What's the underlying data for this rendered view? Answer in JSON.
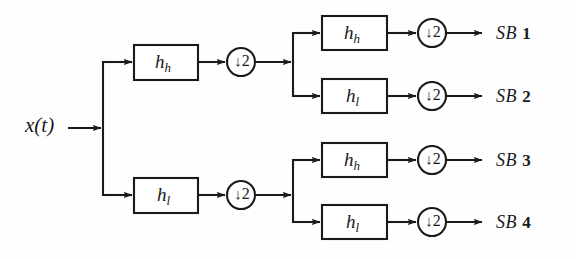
{
  "figure": {
    "background_color": "#fefefe",
    "ink_color": "#1a1a1a",
    "input": {
      "label_main": "x",
      "label_full": "x(t)",
      "x": 25,
      "y": 115
    },
    "decimator_symbol": {
      "arrow": "↓",
      "factor": "2",
      "label": "↓2"
    },
    "stage1": {
      "blocks": [
        {
          "name": "highpass-stage1",
          "base": "h",
          "sub": "h",
          "label": "h_h",
          "box": {
            "x": 134,
            "y": 45,
            "w": 64,
            "h": 35
          },
          "decimator": {
            "cx": 241,
            "cy": 62,
            "r": 14
          }
        },
        {
          "name": "lowpass-stage1",
          "base": "h",
          "sub": "l",
          "label": "h_l",
          "box": {
            "x": 134,
            "y": 178,
            "w": 64,
            "h": 35
          },
          "decimator": {
            "cx": 241,
            "cy": 195,
            "r": 14
          }
        }
      ]
    },
    "stage2": {
      "blocks": [
        {
          "name": "highpass-stage2-a",
          "base": "h",
          "sub": "h",
          "label": "h_h",
          "box": {
            "x": 322,
            "y": 16,
            "w": 65,
            "h": 34
          },
          "decimator": {
            "cx": 432,
            "cy": 33,
            "r": 14
          },
          "output": "SB 1"
        },
        {
          "name": "lowpass-stage2-a",
          "base": "h",
          "sub": "l",
          "label": "h_l",
          "box": {
            "x": 322,
            "y": 79,
            "w": 65,
            "h": 34
          },
          "decimator": {
            "cx": 432,
            "cy": 96,
            "r": 14
          },
          "output": "SB 2"
        },
        {
          "name": "highpass-stage2-b",
          "base": "h",
          "sub": "h",
          "label": "h_h",
          "box": {
            "x": 322,
            "y": 143,
            "w": 65,
            "h": 34
          },
          "decimator": {
            "cx": 432,
            "cy": 160,
            "r": 14
          },
          "output": "SB 3"
        },
        {
          "name": "lowpass-stage2-b",
          "base": "h",
          "sub": "l",
          "label": "h_l",
          "box": {
            "x": 322,
            "y": 205,
            "w": 65,
            "h": 34
          },
          "decimator": {
            "cx": 432,
            "cy": 222,
            "r": 14
          },
          "output": "SB 4"
        }
      ]
    },
    "outputs": [
      {
        "name": "subband-1",
        "prefix": "SB",
        "number": "1",
        "label": "SB 1",
        "x": 496,
        "y": 24
      },
      {
        "name": "subband-2",
        "prefix": "SB",
        "number": "2",
        "label": "SB 2",
        "x": 496,
        "y": 87
      },
      {
        "name": "subband-3",
        "prefix": "SB",
        "number": "3",
        "label": "SB 3",
        "x": 496,
        "y": 151
      },
      {
        "name": "subband-4",
        "prefix": "SB",
        "number": "4",
        "label": "SB 4",
        "x": 496,
        "y": 213
      }
    ],
    "split_nodes": [
      {
        "name": "split-root",
        "x": 103,
        "y_top": 62,
        "y_bottom": 195,
        "y_in": 128
      },
      {
        "name": "split-upper",
        "x": 293,
        "y_top": 33,
        "y_bottom": 96,
        "y_in": 62
      },
      {
        "name": "split-lower",
        "x": 293,
        "y_top": 160,
        "y_bottom": 222,
        "y_in": 195
      }
    ]
  }
}
